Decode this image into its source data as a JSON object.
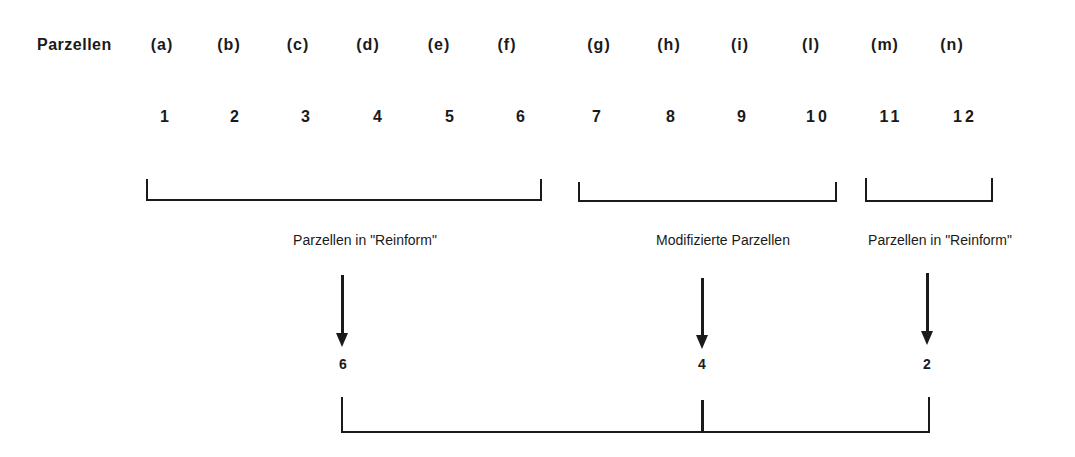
{
  "header": {
    "row_title": "Parzellen",
    "parcels": [
      {
        "label": "(a)",
        "number": "1"
      },
      {
        "label": "(b)",
        "number": "2"
      },
      {
        "label": "(c)",
        "number": "3"
      },
      {
        "label": "(d)",
        "number": "4"
      },
      {
        "label": "(e)",
        "number": "5"
      },
      {
        "label": "(f)",
        "number": "6"
      },
      {
        "label": "(g)",
        "number": "7"
      },
      {
        "label": "(h)",
        "number": "8"
      },
      {
        "label": "(i)",
        "number": "9"
      },
      {
        "label": "(l)",
        "number": "10"
      },
      {
        "label": "(m)",
        "number": "11"
      },
      {
        "label": "(n)",
        "number": "12"
      }
    ]
  },
  "groups": [
    {
      "caption": "Parzellen in \"Reinform\"",
      "parcels": "1-6",
      "count": "6"
    },
    {
      "caption": "Modifizierte Parzellen",
      "parcels": "7-10",
      "count": "4"
    },
    {
      "caption": "Parzellen in \"Reinform\"",
      "parcels": "11-12",
      "count": "2"
    }
  ],
  "colors": {
    "line": "#1a1a1a",
    "background": "#ffffff"
  }
}
